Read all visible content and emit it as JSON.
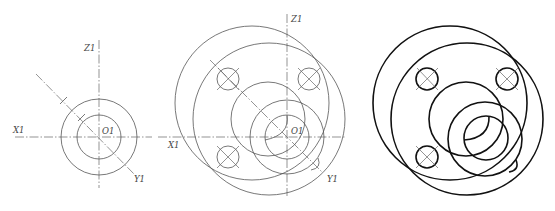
{
  "figure": {
    "panels": [
      {
        "id": "step-1-axes",
        "labels": {
          "z": "Z1",
          "x": "X1",
          "y": "Y1",
          "origin": "O1"
        }
      },
      {
        "id": "step-2-construction",
        "labels": {
          "z": "Z1",
          "x": "X1",
          "y": "Y1",
          "origin": "O1"
        }
      },
      {
        "id": "step-3-final",
        "labels": {}
      }
    ],
    "colors": {
      "construction_line": "#555555",
      "final_line": "#111111",
      "center_line": "#666666",
      "background": "#ffffff"
    }
  }
}
